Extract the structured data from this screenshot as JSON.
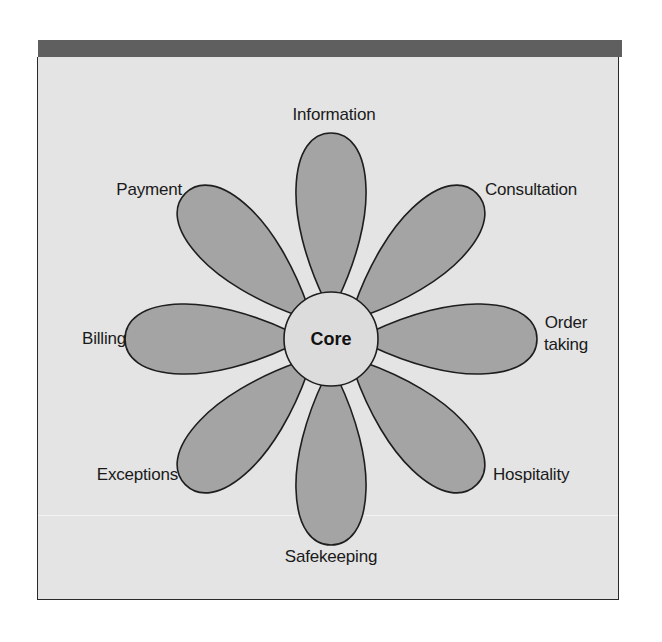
{
  "diagram": {
    "type": "flower-of-service",
    "core": {
      "label": "Core"
    },
    "petals": [
      {
        "id": "information",
        "label": "Information",
        "angle": 0
      },
      {
        "id": "consultation",
        "label": "Consultation",
        "angle": 45
      },
      {
        "id": "order-taking",
        "label": "Order taking",
        "lines": [
          "Order",
          "taking"
        ],
        "angle": 90
      },
      {
        "id": "hospitality",
        "label": "Hospitality",
        "angle": 135
      },
      {
        "id": "safekeeping",
        "label": "Safekeeping",
        "angle": 180
      },
      {
        "id": "exceptions",
        "label": "Exceptions",
        "angle": 225
      },
      {
        "id": "billing",
        "label": "Billing",
        "angle": 270
      },
      {
        "id": "payment",
        "label": "Payment",
        "angle": 315
      }
    ]
  },
  "colors": {
    "header_bar": "#5f5f5f",
    "background": "#e4e4e4",
    "petal_fill": "#a4a4a4",
    "core_fill": "#dcdcdc",
    "outline": "#1e1e1e"
  }
}
